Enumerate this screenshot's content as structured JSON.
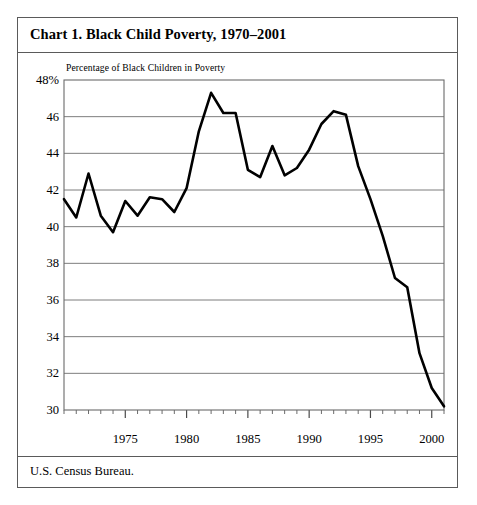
{
  "figure": {
    "title": "Chart 1. Black Child Poverty, 1970–2001",
    "source": "U.S. Census Bureau.",
    "axis_caption": "Percentage of Black Children in Poverty"
  },
  "chart_data": {
    "type": "line",
    "title": "Chart 1. Black Child Poverty, 1970–2001",
    "subtitle": "Percentage of Black Children in Poverty",
    "xlabel": "",
    "ylabel": "Percentage of Black Children in Poverty",
    "source": "U.S. Census Bureau.",
    "xlim": [
      1970,
      2001
    ],
    "ylim": [
      30,
      48
    ],
    "grid": "horizontal",
    "legend": "none",
    "line_color": "#000000",
    "x_tick_labels": [
      "1975",
      "1980",
      "1985",
      "1990",
      "1995",
      "2000"
    ],
    "x_major_ticks": [
      1975,
      1980,
      1985,
      1990,
      1995,
      2000
    ],
    "x_minor_tick_step": 1,
    "y_tick_labels": [
      "48%",
      "46",
      "44",
      "42",
      "40",
      "38",
      "36",
      "34",
      "32",
      "30"
    ],
    "y_ticks": [
      48,
      46,
      44,
      42,
      40,
      38,
      36,
      34,
      32,
      30
    ],
    "x": [
      1970,
      1971,
      1972,
      1973,
      1974,
      1975,
      1976,
      1977,
      1978,
      1979,
      1980,
      1981,
      1982,
      1983,
      1984,
      1985,
      1986,
      1987,
      1988,
      1989,
      1990,
      1991,
      1992,
      1993,
      1994,
      1995,
      1996,
      1997,
      1998,
      1999,
      2000,
      2001
    ],
    "values": [
      41.5,
      40.5,
      42.9,
      40.6,
      39.7,
      41.4,
      40.6,
      41.6,
      41.5,
      40.8,
      42.1,
      45.2,
      47.3,
      46.2,
      46.2,
      43.1,
      42.7,
      44.4,
      42.8,
      43.2,
      44.2,
      45.6,
      46.3,
      46.1,
      43.3,
      41.5,
      39.5,
      37.2,
      36.7,
      33.1,
      31.2,
      30.2
    ]
  }
}
